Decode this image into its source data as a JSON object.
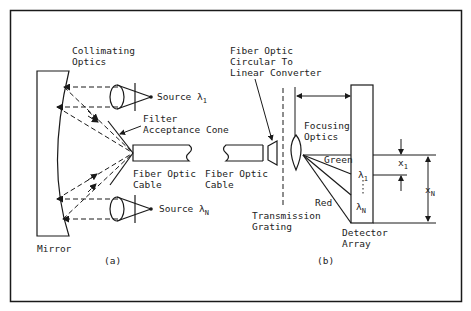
{
  "figure": {
    "panel_a": {
      "caption": "(a)",
      "collimating_optics": [
        "Collimating",
        "Optics"
      ],
      "source_1": {
        "text": "Source ",
        "symbol": "λ",
        "sub": "1"
      },
      "source_n": {
        "text": "Source ",
        "symbol": "λ",
        "sub": "N"
      },
      "filter": [
        "Filter",
        "Acceptance Cone"
      ],
      "fiber_cable": [
        "Fiber Optic",
        "Cable"
      ],
      "mirror": "Mirror"
    },
    "panel_b": {
      "caption": "(b)",
      "converter": [
        "Fiber Optic",
        "Circular To",
        "Linear Converter"
      ],
      "fiber_cable": [
        "Fiber Optic",
        "Cable"
      ],
      "focusing_optics": [
        "Focusing",
        "Optics"
      ],
      "grating": [
        "Transmission",
        "Grating"
      ],
      "green": "Green",
      "red": "Red",
      "lambda_1": {
        "symbol": "λ",
        "sub": "1"
      },
      "lambda_n": {
        "symbol": "λ",
        "sub": "N"
      },
      "x_1": {
        "symbol": "x",
        "sub": "1"
      },
      "x_n": {
        "symbol": "x",
        "sub": "N"
      },
      "detector": [
        "Detector",
        "Array"
      ]
    }
  }
}
